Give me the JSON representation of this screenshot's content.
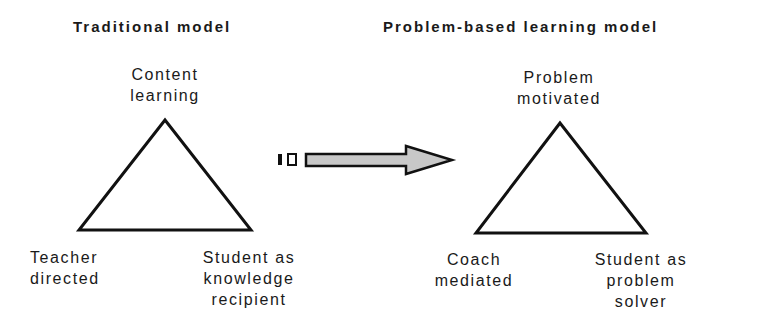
{
  "left_model": {
    "title": "Traditional model",
    "top": [
      "Content",
      "learning"
    ],
    "bottom_left": [
      "Teacher",
      "directed"
    ],
    "bottom_right": [
      "Student as",
      "knowledge",
      "recipient"
    ]
  },
  "right_model": {
    "title": "Problem-based learning model",
    "top": [
      "Problem",
      "motivated"
    ],
    "bottom_left": [
      "Coach",
      "mediated"
    ],
    "bottom_right": [
      "Student as",
      "problem",
      "solver"
    ]
  },
  "arrow": {
    "fill": "#c8c8c8",
    "stroke": "#1a1a1a",
    "direction": "right"
  }
}
